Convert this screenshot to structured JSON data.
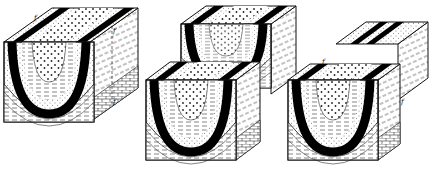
{
  "figure": {
    "blocks": [
      {
        "id": "unfaulted",
        "labels": [
          "f",
          "f",
          "f"
        ]
      },
      {
        "id": "vertical-offset",
        "labels": []
      },
      {
        "id": "horizontal-offset",
        "labels": [
          "f",
          "f"
        ]
      }
    ],
    "fault_label": "f",
    "colors": {
      "ink": "#111111",
      "paper": "#ffffff"
    }
  }
}
